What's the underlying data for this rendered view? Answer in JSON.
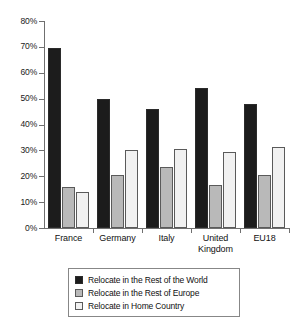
{
  "chart_data": {
    "type": "bar",
    "title": "",
    "subtitle": "",
    "xlabel": "",
    "ylabel": "",
    "ylim": [
      0,
      80
    ],
    "ytick_labels": [
      "0%",
      "10%",
      "20%",
      "30%",
      "40%",
      "50%",
      "60%",
      "70%",
      "80%"
    ],
    "ytick_values": [
      0,
      10,
      20,
      30,
      40,
      50,
      60,
      70,
      80
    ],
    "grid": false,
    "legend_position": "bottom",
    "categories": [
      "France",
      "Germany",
      "Italy",
      "United Kingdom",
      "EU18"
    ],
    "category_label_lines": [
      [
        "France"
      ],
      [
        "Germany"
      ],
      [
        "Italy"
      ],
      [
        "United",
        "Kingdom"
      ],
      [
        "EU18"
      ]
    ],
    "series": [
      {
        "name": "Relocate in the Rest of the World",
        "color": "#1c1c1c",
        "values": [
          69.5,
          50,
          46,
          54,
          48
        ]
      },
      {
        "name": "Relocate in the Rest of Europe",
        "color": "#b9b9b9",
        "values": [
          16,
          20.5,
          23.5,
          16.5,
          20.5
        ]
      },
      {
        "name": "Relocate in Home Country",
        "color": "#f1f1f1",
        "values": [
          14,
          30,
          30.5,
          29.5,
          31.5
        ]
      }
    ]
  },
  "legend": {
    "items": [
      {
        "label": "Relocate in the Rest of the World"
      },
      {
        "label": "Relocate in the Rest of Europe"
      },
      {
        "label": "Relocate in Home Country"
      }
    ]
  }
}
